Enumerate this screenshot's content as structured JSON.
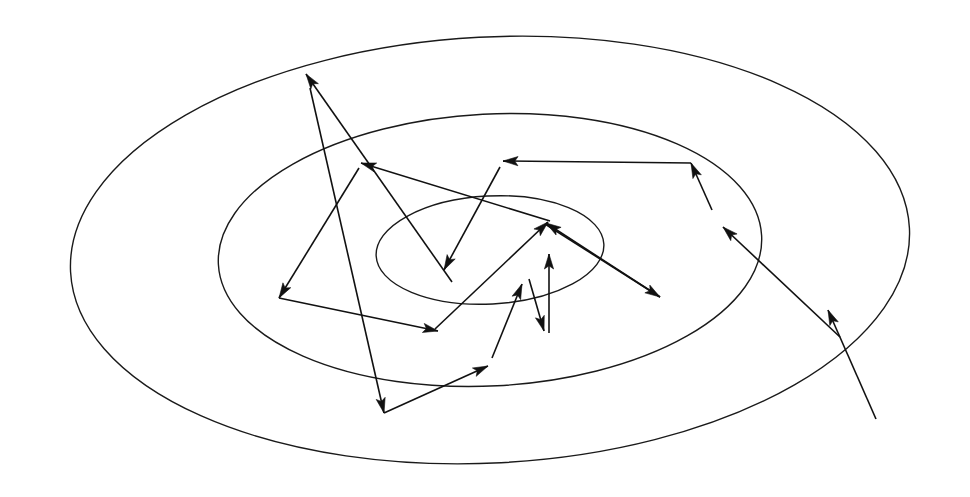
{
  "figure": {
    "title": "Iterative descent path across elliptical contour level sets",
    "kind": "line-diagram",
    "background_color": "#ffffff",
    "stroke_color": "#111111",
    "canvas": {
      "width": 970,
      "height": 497
    }
  },
  "chart_data": {
    "type": "line",
    "title": "Iterative descent path across elliptical contour level sets",
    "subtitle": "",
    "xlabel": "",
    "ylabel": "",
    "grid": false,
    "legend_position": "none",
    "axis_visible": false,
    "tick_labels": [],
    "annotations": [],
    "xlim": [
      0,
      970
    ],
    "ylim": [
      0,
      497
    ],
    "contours": {
      "center": {
        "x": 490,
        "y": 250
      },
      "rotation_deg": -3,
      "levels": [
        {
          "name": "outer-contour",
          "rx": 420,
          "ry": 213
        },
        {
          "name": "middle-contour",
          "rx": 272,
          "ry": 136
        },
        {
          "name": "inner-contour",
          "rx": 114,
          "ry": 54
        }
      ]
    },
    "series": [
      {
        "name": "descent-path",
        "arrowed": true,
        "start_tail": {
          "x": 876,
          "y": 419
        },
        "points": [
          {
            "x": 876,
            "y": 419
          },
          {
            "x": 828,
            "y": 310
          },
          {
            "x": 723,
            "y": 227
          },
          {
            "x": 691,
            "y": 163
          },
          {
            "x": 503,
            "y": 161
          },
          {
            "x": 444,
            "y": 270
          },
          {
            "x": 306,
            "y": 74
          },
          {
            "x": 384,
            "y": 413
          },
          {
            "x": 488,
            "y": 366
          },
          {
            "x": 522,
            "y": 284
          },
          {
            "x": 544,
            "y": 331
          },
          {
            "x": 549,
            "y": 254
          },
          {
            "x": 660,
            "y": 297
          },
          {
            "x": 546,
            "y": 223
          },
          {
            "x": 361,
            "y": 163
          },
          {
            "x": 279,
            "y": 298
          },
          {
            "x": 438,
            "y": 331
          },
          {
            "x": 548,
            "y": 222
          }
        ]
      }
    ]
  },
  "elements": {
    "ellipses": [
      {
        "id": "outer-contour",
        "cx": 490,
        "cy": 250,
        "rx": 420,
        "ry": 213,
        "rot": -3
      },
      {
        "id": "middle-contour",
        "cx": 490,
        "cy": 250,
        "rx": 272,
        "ry": 136,
        "rot": -3
      },
      {
        "id": "inner-contour",
        "cx": 490,
        "cy": 250,
        "rx": 114,
        "ry": 54,
        "rot": -3
      }
    ],
    "segments": [
      {
        "id": "seg-01",
        "x1": 876,
        "y1": 419,
        "x2": 828,
        "y2": 310,
        "arrow": true
      },
      {
        "id": "seg-02",
        "x1": 840,
        "y1": 337,
        "x2": 723,
        "y2": 227,
        "arrow": true
      },
      {
        "id": "seg-03",
        "x1": 712,
        "y1": 210,
        "x2": 691,
        "y2": 163,
        "arrow": true
      },
      {
        "id": "seg-04",
        "x1": 691,
        "y1": 163,
        "x2": 503,
        "y2": 161,
        "arrow": true
      },
      {
        "id": "seg-05",
        "x1": 500,
        "y1": 167,
        "x2": 444,
        "y2": 270,
        "arrow": true
      },
      {
        "id": "seg-06",
        "x1": 452,
        "y1": 282,
        "x2": 306,
        "y2": 74,
        "arrow": true
      },
      {
        "id": "seg-07",
        "x1": 310,
        "y1": 88,
        "x2": 384,
        "y2": 413,
        "arrow": true
      },
      {
        "id": "seg-08",
        "x1": 384,
        "y1": 413,
        "x2": 488,
        "y2": 366,
        "arrow": true
      },
      {
        "id": "seg-09",
        "x1": 492,
        "y1": 358,
        "x2": 522,
        "y2": 284,
        "arrow": true
      },
      {
        "id": "seg-10",
        "x1": 529,
        "y1": 279,
        "x2": 544,
        "y2": 331,
        "arrow": true
      },
      {
        "id": "seg-11",
        "x1": 549,
        "y1": 333,
        "x2": 549,
        "y2": 254,
        "arrow": true
      },
      {
        "id": "seg-12",
        "x1": 545,
        "y1": 224,
        "x2": 660,
        "y2": 297,
        "arrow": true
      },
      {
        "id": "seg-13",
        "x1": 660,
        "y1": 297,
        "x2": 546,
        "y2": 223,
        "arrow": true
      },
      {
        "id": "seg-14",
        "x1": 550,
        "y1": 221,
        "x2": 361,
        "y2": 163,
        "arrow": true
      },
      {
        "id": "seg-15",
        "x1": 359,
        "y1": 168,
        "x2": 279,
        "y2": 298,
        "arrow": true
      },
      {
        "id": "seg-16",
        "x1": 279,
        "y1": 298,
        "x2": 438,
        "y2": 331,
        "arrow": true
      },
      {
        "id": "seg-17",
        "x1": 435,
        "y1": 329,
        "x2": 548,
        "y2": 222,
        "arrow": true
      }
    ]
  }
}
